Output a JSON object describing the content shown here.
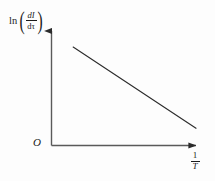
{
  "figure": {
    "background_color": "#fdfdfd",
    "ink_color": "#2b2b2b"
  },
  "axes": {
    "origin_label": "O",
    "y_label": {
      "function": "ln",
      "open_paren": "(",
      "close_paren": ")",
      "numerator": "dI",
      "denominator": "dτ",
      "plain": "ln(dI/dτ)"
    },
    "x_label": {
      "numerator": "1",
      "denominator": "T",
      "plain": "1/T"
    }
  },
  "chart_data": {
    "type": "line",
    "title": "",
    "subtitle": "",
    "xlabel": "1/T",
    "ylabel": "ln(dI/dτ)",
    "xlim": [
      0,
      1
    ],
    "ylim": [
      0,
      1
    ],
    "grid": false,
    "legend": null,
    "axis_style": {
      "x_axis": "arrow pointing right",
      "y_axis": "arrow pointing up",
      "ticks": "none",
      "tick_labels": "none"
    },
    "annotations": [],
    "series": [
      {
        "name": "ln(dI/dτ) vs 1/T",
        "description": "single straight line with negative slope",
        "relationship": "linear decreasing",
        "x": [
          0.15,
          1.0
        ],
        "y": [
          0.86,
          0.15
        ],
        "slope": -0.835,
        "color": "#2b2b2b",
        "linewidth": 1.1,
        "style": "solid"
      }
    ]
  }
}
